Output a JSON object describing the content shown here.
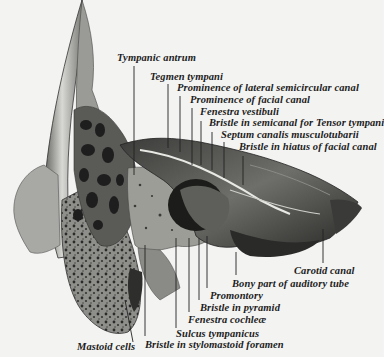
{
  "figure": {
    "labels": {
      "tympanic_antrum": "Tympanic antrum",
      "tegmen_tympani": "Tegmen tympani",
      "prominence_lateral_semicircular": "Prominence of lateral semicircular canal",
      "prominence_facial_canal": "Prominence of facial canal",
      "fenestra_vestibuli": "Fenestra vestibuli",
      "bristle_semicanal_tensor": "Bristle in semicanal for Tensor tympani",
      "septum_canalis": "Septum canalis musculotubarii",
      "bristle_hiatus_facial": "Bristle in hiatus of facial canal",
      "carotid_canal": "Carotid canal",
      "bony_part_auditory_tube": "Bony part of auditory tube",
      "promontory": "Promontory",
      "bristle_pyramid": "Bristle in pyramid",
      "fenestra_cochleae": "Fenestra cochleæ",
      "sulcus_tympanicus": "Sulcus tympanicus",
      "bristle_stylomastoid": "Bristle in stylomastoid foramen",
      "mastoid_cells": "Mastoid cells"
    }
  }
}
